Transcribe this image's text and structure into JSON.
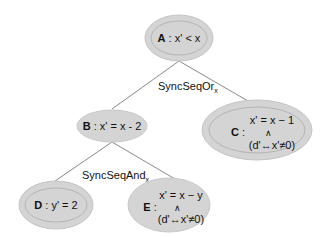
{
  "diagram": {
    "colors": {
      "node_fill": "#d4d4d4",
      "node_stroke": "#b8b8b8",
      "edge": "#8a8a8a",
      "text": "#111111"
    },
    "nodes": {
      "A": {
        "id": "A",
        "sep": " : ",
        "expr": "x' < x"
      },
      "B": {
        "id": "B",
        "sep": " : ",
        "expr": "x' = x - 2"
      },
      "C": {
        "id": "C",
        "sep": " :",
        "line1": "x' = x − 1",
        "conj": "∧",
        "line2": "(d'↔x'≠0)"
      },
      "D": {
        "id": "D",
        "sep": " : ",
        "expr": "y' =  2"
      },
      "E": {
        "id": "E",
        "sep": " :",
        "line1": "x' = x − y",
        "conj": "∧",
        "line2": "(d'↔x'≠0)"
      }
    },
    "edges": [
      {
        "from": "A",
        "to": "B"
      },
      {
        "from": "A",
        "to": "C"
      },
      {
        "from": "B",
        "to": "D"
      },
      {
        "from": "B",
        "to": "E"
      }
    ],
    "edge_labels": {
      "or": {
        "text": "SyncSeqOr",
        "sub": "x"
      },
      "and": {
        "text": "SyncSeqAnd",
        "sub": "x"
      }
    }
  }
}
